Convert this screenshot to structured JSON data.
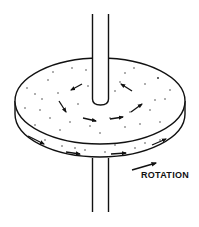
{
  "diagram": {
    "title": "",
    "labels": {
      "rotation": "ROTATION"
    },
    "components": [
      "vertical-shaft",
      "disk-top-face",
      "disk-rim",
      "flow-arrows",
      "particles",
      "rotation-arrow"
    ],
    "colors": {
      "line": "#111111",
      "background": "#ffffff"
    }
  }
}
